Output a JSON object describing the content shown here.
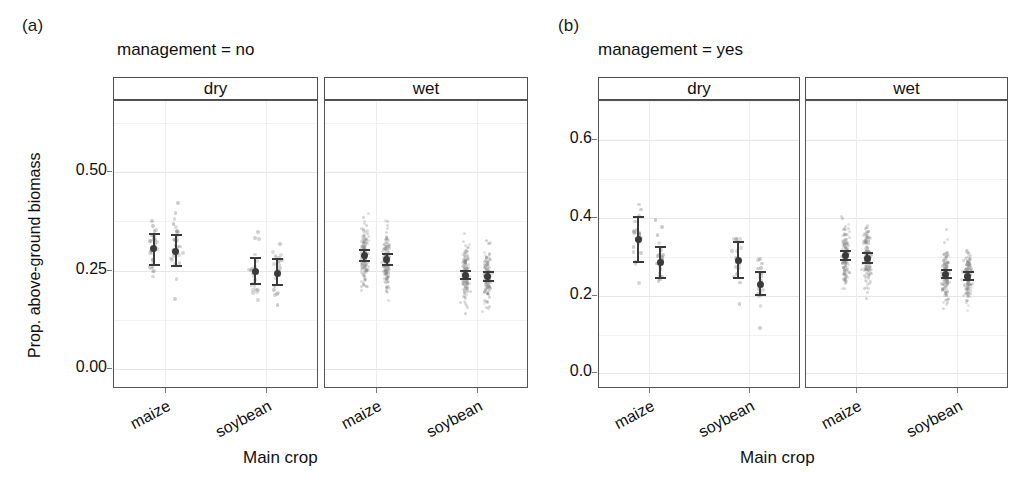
{
  "figure": {
    "panels": [
      {
        "letter": "(a)",
        "title": "management = no",
        "y_axis_label": "Prop. above-ground biomass",
        "x_axis_label": "Main crop",
        "y_ticks": [
          "0.50",
          "0.25",
          "0.00"
        ],
        "facets": [
          "dry",
          "wet"
        ],
        "x_ticks": [
          "maize",
          "soybean",
          "maize",
          "soybean"
        ]
      },
      {
        "letter": "(b)",
        "title": "management = yes",
        "y_axis_label": "",
        "x_axis_label": "Main crop",
        "y_ticks": [
          "0.6",
          "0.4",
          "0.2",
          "0.0"
        ],
        "facets": [
          "dry",
          "wet"
        ],
        "x_ticks": [
          "maize",
          "soybean",
          "maize",
          "soybean"
        ]
      }
    ],
    "colors": {
      "point": "#8c8c8c",
      "errorbar": "#3a3a3a",
      "grid": "#e6e6e6",
      "panel_border": "#555555",
      "strip_border": "#4d4d4d",
      "text": "#111111"
    }
  },
  "chart_data": {
    "type": "scatter",
    "xlabel": "Main crop",
    "ylabel": "Prop. above-ground biomass",
    "grid": true,
    "legend": "none",
    "panels": [
      {
        "letter": "(a)",
        "management": "no",
        "ylim": [
          -0.05,
          0.68
        ],
        "yticks": [
          0.0,
          0.25,
          0.5
        ],
        "facets": [
          {
            "water": "dry",
            "groups": [
              {
                "crop": "maize",
                "subgroup": 1,
                "mean": 0.305,
                "ci_low": 0.262,
                "ci_high": 0.345,
                "n_points": 28,
                "point_spread": [
                  0.03,
                  0.52
                ]
              },
              {
                "crop": "maize",
                "subgroup": 2,
                "mean": 0.298,
                "ci_low": 0.258,
                "ci_high": 0.343,
                "n_points": 30,
                "point_spread": [
                  0.05,
                  0.5
                ]
              },
              {
                "crop": "soybean",
                "subgroup": 1,
                "mean": 0.247,
                "ci_low": 0.213,
                "ci_high": 0.285,
                "n_points": 22,
                "point_spread": [
                  0.05,
                  0.55
                ]
              },
              {
                "crop": "soybean",
                "subgroup": 2,
                "mean": 0.243,
                "ci_low": 0.212,
                "ci_high": 0.282,
                "n_points": 20,
                "point_spread": [
                  0.04,
                  0.47
                ]
              }
            ]
          },
          {
            "water": "wet",
            "groups": [
              {
                "crop": "maize",
                "subgroup": 1,
                "mean": 0.288,
                "ci_low": 0.272,
                "ci_high": 0.305,
                "n_points": 150,
                "point_spread": [
                  0.02,
                  0.57
                ]
              },
              {
                "crop": "maize",
                "subgroup": 2,
                "mean": 0.278,
                "ci_low": 0.262,
                "ci_high": 0.295,
                "n_points": 150,
                "point_spread": [
                  0.02,
                  0.55
                ]
              },
              {
                "crop": "soybean",
                "subgroup": 1,
                "mean": 0.238,
                "ci_low": 0.225,
                "ci_high": 0.252,
                "n_points": 150,
                "point_spread": [
                  0.01,
                  0.5
                ]
              },
              {
                "crop": "soybean",
                "subgroup": 2,
                "mean": 0.235,
                "ci_low": 0.222,
                "ci_high": 0.25,
                "n_points": 150,
                "point_spread": [
                  0.01,
                  0.48
                ]
              }
            ]
          }
        ]
      },
      {
        "letter": "(b)",
        "management": "yes",
        "ylim": [
          -0.04,
          0.7
        ],
        "yticks": [
          0.0,
          0.2,
          0.4,
          0.6
        ],
        "facets": [
          {
            "water": "dry",
            "groups": [
              {
                "crop": "maize",
                "subgroup": 1,
                "mean": 0.345,
                "ci_low": 0.283,
                "ci_high": 0.405,
                "n_points": 22,
                "point_spread": [
                  0.03,
                  0.5
                ]
              },
              {
                "crop": "maize",
                "subgroup": 2,
                "mean": 0.285,
                "ci_low": 0.242,
                "ci_high": 0.328,
                "n_points": 22,
                "point_spread": [
                  0.03,
                  0.47
                ]
              },
              {
                "crop": "soybean",
                "subgroup": 1,
                "mean": 0.29,
                "ci_low": 0.243,
                "ci_high": 0.34,
                "n_points": 18,
                "point_spread": [
                  0.05,
                  0.52
                ]
              },
              {
                "crop": "soybean",
                "subgroup": 2,
                "mean": 0.228,
                "ci_low": 0.198,
                "ci_high": 0.262,
                "n_points": 18,
                "point_spread": [
                  0.05,
                  0.48
                ]
              }
            ]
          },
          {
            "water": "wet",
            "groups": [
              {
                "crop": "maize",
                "subgroup": 1,
                "mean": 0.302,
                "ci_low": 0.288,
                "ci_high": 0.318,
                "n_points": 150,
                "point_spread": [
                  0.03,
                  0.58
                ]
              },
              {
                "crop": "maize",
                "subgroup": 2,
                "mean": 0.296,
                "ci_low": 0.282,
                "ci_high": 0.312,
                "n_points": 150,
                "point_spread": [
                  0.03,
                  0.56
                ]
              },
              {
                "crop": "soybean",
                "subgroup": 1,
                "mean": 0.255,
                "ci_low": 0.243,
                "ci_high": 0.268,
                "n_points": 150,
                "point_spread": [
                  0.02,
                  0.52
                ]
              },
              {
                "crop": "soybean",
                "subgroup": 2,
                "mean": 0.25,
                "ci_low": 0.238,
                "ci_high": 0.263,
                "n_points": 150,
                "point_spread": [
                  0.02,
                  0.5
                ]
              }
            ]
          }
        ]
      }
    ]
  }
}
